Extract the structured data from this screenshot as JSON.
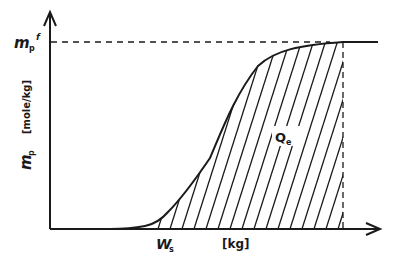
{
  "diagram": {
    "type": "breakthrough-curve",
    "y_axis": {
      "symbol": "m",
      "symbol_sub": "p",
      "unit": "[mole/kg]"
    },
    "plateau_label": {
      "symbol": "m",
      "symbol_sub": "p",
      "symbol_sup": "f"
    },
    "x_axis": {
      "unit": "[kg]",
      "marker_symbol": "W",
      "marker_sub": "s"
    },
    "area_label": {
      "symbol": "Q",
      "symbol_sub": "e"
    },
    "colors": {
      "ink": "#1a1a1a",
      "background": "#ffffff"
    }
  }
}
